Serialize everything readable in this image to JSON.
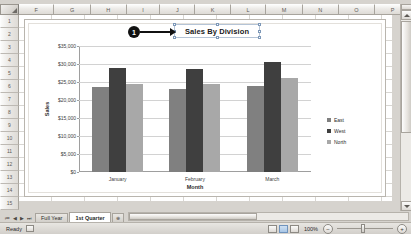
{
  "spreadsheet": {
    "column_headers": [
      "F",
      "G",
      "H",
      "I",
      "J",
      "K",
      "L",
      "M",
      "N",
      "O",
      "P"
    ],
    "row_headers": [
      "1",
      "2",
      "3",
      "4",
      "5",
      "6",
      "7",
      "8",
      "9",
      "10",
      "11",
      "12",
      "13",
      "14",
      "15"
    ],
    "sheet_tabs": [
      {
        "label": "Full Year",
        "active": false
      },
      {
        "label": "1st Quarter",
        "active": true
      }
    ],
    "new_sheet_label": "⊕",
    "nav_buttons": [
      "⏮",
      "◀",
      "▶",
      "⏭"
    ]
  },
  "callout": {
    "number": "1"
  },
  "status_bar": {
    "status_text": "Ready",
    "zoom_level": "100%",
    "zoom_out_label": "−",
    "zoom_in_label": "+"
  },
  "chart_data": {
    "type": "bar",
    "title": "Sales By Division",
    "xlabel": "Month",
    "ylabel": "Sales",
    "categories": [
      "January",
      "February",
      "March"
    ],
    "series": [
      {
        "name": "East",
        "values": [
          23500,
          23000,
          24000
        ],
        "color": "#808080"
      },
      {
        "name": "West",
        "values": [
          29000,
          28500,
          30500
        ],
        "color": "#3f3f3f"
      },
      {
        "name": "North",
        "values": [
          24500,
          24500,
          26000
        ],
        "color": "#a8a8a8"
      }
    ],
    "ylim": [
      0,
      35000
    ],
    "ytick_values": [
      0,
      5000,
      10000,
      15000,
      20000,
      25000,
      30000,
      35000
    ],
    "ytick_labels": [
      "$0",
      "$5,000",
      "$10,000",
      "$15,000",
      "$20,000",
      "$25,000",
      "$30,000",
      "$35,000"
    ],
    "grid": true,
    "legend_position": "right"
  }
}
